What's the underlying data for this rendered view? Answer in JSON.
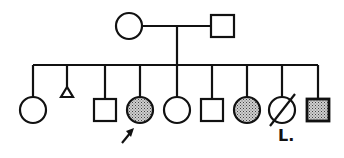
{
  "diagram": {
    "type": "pedigree",
    "colors": {
      "line": "#111111",
      "fill_affected": "#9a9a9a",
      "background": "#ffffff"
    },
    "parents": [
      {
        "id": "mother",
        "sex": "female",
        "affected": false,
        "x": 129,
        "y": 26
      },
      {
        "id": "father",
        "sex": "male",
        "affected": false,
        "x": 222,
        "y": 26
      }
    ],
    "children": [
      {
        "id": "c1",
        "sex": "female",
        "affected": false,
        "x": 33
      },
      {
        "id": "c2",
        "sex": "miscarriage",
        "affected": false,
        "x": 67
      },
      {
        "id": "c3",
        "sex": "male",
        "affected": false,
        "x": 105
      },
      {
        "id": "c4",
        "sex": "female",
        "affected": true,
        "proband": true,
        "x": 140
      },
      {
        "id": "c5",
        "sex": "female",
        "affected": false,
        "x": 177
      },
      {
        "id": "c6",
        "sex": "male",
        "affected": false,
        "x": 212
      },
      {
        "id": "c7",
        "sex": "female",
        "affected": true,
        "x": 247
      },
      {
        "id": "c8",
        "sex": "female",
        "affected": false,
        "deceased": true,
        "x": 282,
        "label": "L."
      },
      {
        "id": "c9",
        "sex": "male",
        "affected": true,
        "x": 318
      }
    ],
    "proband_marker": "arrow"
  }
}
